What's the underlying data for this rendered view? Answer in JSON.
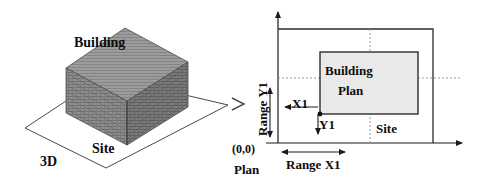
{
  "figure": {
    "left_panel": {
      "name": "3d-view",
      "building_label": "Building",
      "site_label": "Site",
      "view_label": "3D"
    },
    "right_panel": {
      "name": "plan-view",
      "building_label": "Building",
      "plan_label": "Plan",
      "site_label": "Site",
      "view_label": "Plan",
      "origin_label": "(0,0)",
      "x_offset_label": "X1",
      "y_offset_label": "Y1",
      "range_x_label": "Range X1",
      "range_y_label": "Range Y1"
    },
    "colors": {
      "stroke": "#1a1a1a",
      "building_fill_3d": "#8d8d8d",
      "building_fill_plan": "#e8e8e8",
      "dotted_guide": "#9a9a9a",
      "site_outline": "#2b2b2b"
    }
  }
}
